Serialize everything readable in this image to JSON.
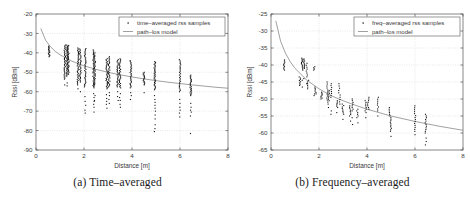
{
  "figure": {
    "panels": [
      {
        "id": "panel-a",
        "caption_label": "(a)",
        "caption_text": "Time–averaged",
        "chart_data": {
          "type": "scatter",
          "title": "",
          "xlabel": "Distance [m]",
          "ylabel": "Rssi [dBm]",
          "xlim": [
            0,
            8
          ],
          "ylim": [
            -90,
            -20
          ],
          "xticks": [
            0,
            2,
            4,
            6,
            8
          ],
          "yticks": [
            -20,
            -30,
            -40,
            -50,
            -60,
            -70,
            -80,
            -90
          ],
          "grid": true,
          "legend_position": "top-right",
          "legend": [
            {
              "marker": "dot",
              "label": "time–averaged rss samples"
            },
            {
              "marker": "line",
              "label": "path–los model"
            }
          ],
          "series": [
            {
              "name": "time–averaged rss samples",
              "type": "scatter",
              "clusters": [
                {
                  "x": 0.55,
                  "ymin": -42.0,
                  "ymax": -36.5,
                  "n": 16,
                  "extra": []
                },
                {
                  "x": 1.2,
                  "ymin": -53.5,
                  "ymax": -36.0,
                  "n": 34,
                  "extra": [
                    -56.5
                  ]
                },
                {
                  "x": 1.3,
                  "ymin": -52.0,
                  "ymax": -36.0,
                  "n": 32,
                  "extra": [
                    -55.5,
                    -57.0
                  ]
                },
                {
                  "x": 1.35,
                  "ymin": -51.0,
                  "ymax": -36.2,
                  "n": 30,
                  "extra": []
                },
                {
                  "x": 1.75,
                  "ymin": -56.5,
                  "ymax": -37.5,
                  "n": 34,
                  "extra": [
                    -58.5
                  ]
                },
                {
                  "x": 1.85,
                  "ymin": -55.0,
                  "ymax": -38.0,
                  "n": 30,
                  "extra": [
                    -60.0
                  ]
                },
                {
                  "x": 2.05,
                  "ymin": -57.5,
                  "ymax": -37.8,
                  "n": 34,
                  "extra": [
                    -62.5,
                    -65.0,
                    -67.0,
                    -69.5,
                    -71.0
                  ]
                },
                {
                  "x": 2.4,
                  "ymin": -58.0,
                  "ymax": -38.5,
                  "n": 34,
                  "extra": [
                    -61.0,
                    -63.0,
                    -65.0,
                    -66.5,
                    -68.0,
                    -70.5
                  ]
                },
                {
                  "x": 2.45,
                  "ymin": -57.0,
                  "ymax": -40.0,
                  "n": 28,
                  "extra": [
                    -62.0,
                    -64.5
                  ]
                },
                {
                  "x": 2.95,
                  "ymin": -58.5,
                  "ymax": -43.0,
                  "n": 30,
                  "extra": [
                    -61.5,
                    -63.5,
                    -65.0,
                    -66.5,
                    -68.5
                  ]
                },
                {
                  "x": 3.05,
                  "ymin": -57.5,
                  "ymax": -42.0,
                  "n": 28,
                  "extra": [
                    -60.5,
                    -62.0,
                    -64.0,
                    -66.0
                  ]
                },
                {
                  "x": 3.4,
                  "ymin": -57.5,
                  "ymax": -43.5,
                  "n": 26,
                  "extra": [
                    -60.0,
                    -62.5,
                    -64.5
                  ]
                },
                {
                  "x": 3.5,
                  "ymin": -58.0,
                  "ymax": -43.0,
                  "n": 28,
                  "extra": [
                    -61.0,
                    -63.0,
                    -64.5,
                    -66.5,
                    -68.0
                  ]
                },
                {
                  "x": 3.95,
                  "ymin": -58.0,
                  "ymax": -44.0,
                  "n": 26,
                  "extra": [
                    -60.5,
                    -62.0,
                    -64.0
                  ]
                },
                {
                  "x": 4.5,
                  "ymin": -56.5,
                  "ymax": -50.0,
                  "n": 16,
                  "extra": [
                    -60.5
                  ]
                },
                {
                  "x": 4.95,
                  "ymin": -59.0,
                  "ymax": -44.5,
                  "n": 32,
                  "extra": [
                    -62.0,
                    -64.0,
                    -65.5,
                    -67.0,
                    -68.5,
                    -70.0,
                    -72.0,
                    -74.0,
                    -77.0,
                    -79.0,
                    -80.5
                  ]
                },
                {
                  "x": 6.0,
                  "ymin": -60.0,
                  "ymax": -43.5,
                  "n": 26,
                  "extra": [
                    -64.0,
                    -66.0,
                    -68.0,
                    -69.5,
                    -71.0,
                    -73.0
                  ]
                },
                {
                  "x": 6.45,
                  "ymin": -62.0,
                  "ymax": -51.5,
                  "n": 24,
                  "extra": [
                    -66.0,
                    -68.0,
                    -69.5,
                    -70.5,
                    -72.5,
                    -81.5
                  ]
                }
              ]
            },
            {
              "name": "path–los model",
              "type": "line",
              "model": "log-distance",
              "points": [
                {
                  "x": 0.2,
                  "y": -27.5
                },
                {
                  "x": 0.4,
                  "y": -33.5
                },
                {
                  "x": 0.6,
                  "y": -36.8
                },
                {
                  "x": 0.8,
                  "y": -39.2
                },
                {
                  "x": 1.0,
                  "y": -41.0
                },
                {
                  "x": 1.5,
                  "y": -44.3
                },
                {
                  "x": 2.0,
                  "y": -46.7
                },
                {
                  "x": 2.5,
                  "y": -48.5
                },
                {
                  "x": 3.0,
                  "y": -50.0
                },
                {
                  "x": 3.5,
                  "y": -51.3
                },
                {
                  "x": 4.0,
                  "y": -52.4
                },
                {
                  "x": 4.5,
                  "y": -53.4
                },
                {
                  "x": 5.0,
                  "y": -54.3
                },
                {
                  "x": 5.5,
                  "y": -55.1
                },
                {
                  "x": 6.0,
                  "y": -55.8
                },
                {
                  "x": 6.5,
                  "y": -56.5
                },
                {
                  "x": 7.0,
                  "y": -57.1
                },
                {
                  "x": 7.5,
                  "y": -57.7
                },
                {
                  "x": 8.0,
                  "y": -58.2
                }
              ]
            }
          ]
        }
      },
      {
        "id": "panel-b",
        "caption_label": "(b)",
        "caption_text": "Frequency–averaged",
        "chart_data": {
          "type": "scatter",
          "title": "",
          "xlabel": "Distance [m]",
          "ylabel": "Rssi [dBm]",
          "xlim": [
            0,
            8
          ],
          "ylim": [
            -65,
            -25
          ],
          "xticks": [
            0,
            2,
            4,
            6,
            8
          ],
          "yticks": [
            -25,
            -30,
            -35,
            -40,
            -45,
            -50,
            -55,
            -60,
            -65
          ],
          "grid": true,
          "legend_position": "top-right",
          "legend": [
            {
              "marker": "dot",
              "label": "freq–averaged rss samples"
            },
            {
              "marker": "line",
              "label": "path–los model"
            }
          ],
          "series": [
            {
              "name": "freq–averaged rss samples",
              "type": "scatter",
              "clusters": [
                {
                  "x": 0.55,
                  "ymin": -41.5,
                  "ymax": -38.5,
                  "n": 10,
                  "extra": []
                },
                {
                  "x": 1.2,
                  "ymin": -46.0,
                  "ymax": -43.5,
                  "n": 8,
                  "extra": []
                },
                {
                  "x": 1.3,
                  "ymin": -41.5,
                  "ymax": -38.0,
                  "n": 12,
                  "extra": [
                    -44.5,
                    -46.5
                  ]
                },
                {
                  "x": 1.38,
                  "ymin": -41.0,
                  "ymax": -38.2,
                  "n": 10,
                  "extra": [
                    -44.0
                  ]
                },
                {
                  "x": 1.5,
                  "ymin": -43.5,
                  "ymax": -39.5,
                  "n": 8,
                  "extra": [
                    -45.5
                  ]
                },
                {
                  "x": 1.55,
                  "ymin": -47.0,
                  "ymax": -44.5,
                  "n": 6,
                  "extra": []
                },
                {
                  "x": 1.8,
                  "ymin": -41.5,
                  "ymax": -40.5,
                  "n": 4,
                  "extra": [
                    -48.5,
                    -49.0
                  ]
                },
                {
                  "x": 1.85,
                  "ymin": -48.5,
                  "ymax": -46.5,
                  "n": 6,
                  "extra": []
                },
                {
                  "x": 2.1,
                  "ymin": -50.0,
                  "ymax": -48.0,
                  "n": 8,
                  "extra": []
                },
                {
                  "x": 2.35,
                  "ymin": -51.5,
                  "ymax": -45.0,
                  "n": 12,
                  "extra": []
                },
                {
                  "x": 2.4,
                  "ymin": -50.5,
                  "ymax": -47.5,
                  "n": 8,
                  "extra": [
                    -52.5
                  ]
                },
                {
                  "x": 2.5,
                  "ymin": -49.5,
                  "ymax": -45.5,
                  "n": 8,
                  "extra": [
                    -53.5,
                    -54.5
                  ]
                },
                {
                  "x": 2.75,
                  "ymin": -52.5,
                  "ymax": -50.5,
                  "n": 6,
                  "extra": [
                    -54.0
                  ]
                },
                {
                  "x": 2.85,
                  "ymin": -51.5,
                  "ymax": -45.5,
                  "n": 10,
                  "extra": []
                },
                {
                  "x": 3.0,
                  "ymin": -54.5,
                  "ymax": -51.5,
                  "n": 8,
                  "extra": [
                    -56.0
                  ]
                },
                {
                  "x": 3.3,
                  "ymin": -55.0,
                  "ymax": -52.0,
                  "n": 8,
                  "extra": [
                    -56.5
                  ]
                },
                {
                  "x": 3.4,
                  "ymin": -53.5,
                  "ymax": -50.0,
                  "n": 8,
                  "extra": [
                    -55.5,
                    -57.5
                  ]
                },
                {
                  "x": 3.6,
                  "ymin": -55.5,
                  "ymax": -53.0,
                  "n": 6,
                  "extra": [
                    -57.0
                  ]
                },
                {
                  "x": 3.95,
                  "ymin": -54.0,
                  "ymax": -50.5,
                  "n": 8,
                  "extra": [
                    -55.5
                  ]
                },
                {
                  "x": 4.05,
                  "ymin": -53.0,
                  "ymax": -49.5,
                  "n": 8,
                  "extra": []
                },
                {
                  "x": 4.45,
                  "ymin": -53.5,
                  "ymax": -49.5,
                  "n": 8,
                  "extra": [
                    -55.0
                  ]
                },
                {
                  "x": 4.95,
                  "ymin": -55.0,
                  "ymax": -52.5,
                  "n": 6,
                  "extra": []
                },
                {
                  "x": 5.0,
                  "ymin": -59.5,
                  "ymax": -55.5,
                  "n": 10,
                  "extra": [
                    -61.0
                  ]
                },
                {
                  "x": 6.0,
                  "ymin": -59.5,
                  "ymax": -52.0,
                  "n": 14,
                  "extra": [
                    -60.5
                  ]
                },
                {
                  "x": 6.45,
                  "ymin": -60.0,
                  "ymax": -54.5,
                  "n": 12,
                  "extra": [
                    -61.5,
                    -62.5,
                    -63.5
                  ]
                }
              ]
            },
            {
              "name": "path–los model",
              "type": "line",
              "model": "log-distance",
              "points": [
                {
                  "x": 0.2,
                  "y": -27.0
                },
                {
                  "x": 0.4,
                  "y": -33.0
                },
                {
                  "x": 0.6,
                  "y": -36.5
                },
                {
                  "x": 0.8,
                  "y": -39.0
                },
                {
                  "x": 1.0,
                  "y": -41.0
                },
                {
                  "x": 1.5,
                  "y": -44.5
                },
                {
                  "x": 2.0,
                  "y": -47.0
                },
                {
                  "x": 2.5,
                  "y": -49.0
                },
                {
                  "x": 3.0,
                  "y": -50.5
                },
                {
                  "x": 3.5,
                  "y": -51.8
                },
                {
                  "x": 4.0,
                  "y": -53.0
                },
                {
                  "x": 4.5,
                  "y": -54.0
                },
                {
                  "x": 5.0,
                  "y": -55.0
                },
                {
                  "x": 5.5,
                  "y": -55.8
                },
                {
                  "x": 6.0,
                  "y": -56.6
                },
                {
                  "x": 6.5,
                  "y": -57.3
                },
                {
                  "x": 7.0,
                  "y": -58.0
                },
                {
                  "x": 7.5,
                  "y": -58.6
                },
                {
                  "x": 8.0,
                  "y": -59.2
                }
              ]
            }
          ]
        }
      }
    ]
  },
  "colors": {
    "sample_marker": "#141414",
    "model_line": "#6d6d6d",
    "axis": "#555555",
    "grid": "#b9b9b9",
    "background": "#ffffff",
    "caption_text": "#1a1a1a"
  }
}
